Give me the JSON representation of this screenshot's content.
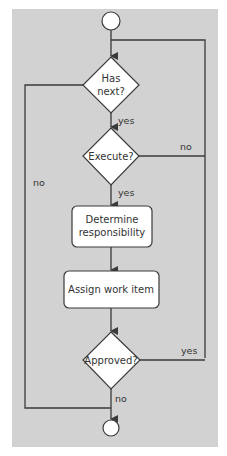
{
  "colors": {
    "background": "#ffffff",
    "panel": "#d2d2d2",
    "line": "#3a3a3a",
    "node_fill": "#ffffff",
    "text": "#333333"
  },
  "nodes": {
    "start": {
      "type": "start-circle"
    },
    "has_next": {
      "type": "decision",
      "lines": [
        "Has",
        "next?"
      ]
    },
    "execute": {
      "type": "decision",
      "label": "Execute?"
    },
    "determine": {
      "type": "process",
      "lines": [
        "Determine",
        "responsibility"
      ]
    },
    "assign": {
      "type": "process",
      "label": "Assign work item"
    },
    "approved": {
      "type": "decision",
      "label": "Approved?"
    },
    "end": {
      "type": "end-circle"
    }
  },
  "edges": {
    "has_next_yes": "yes",
    "has_next_no": "no",
    "execute_yes": "yes",
    "execute_no": "no",
    "approved_yes": "yes",
    "approved_no": "no"
  }
}
